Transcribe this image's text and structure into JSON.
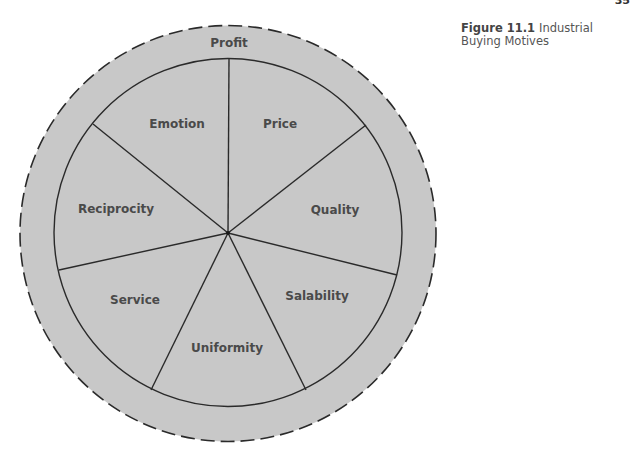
{
  "page_number": "35",
  "caption": {
    "label": "Figure 11.1",
    "title": "Industrial Buying Motives"
  },
  "diagram": {
    "type": "segmented-circle",
    "fill_color": "#c8c8c8",
    "line_color": "#2a2a2a",
    "text_color": "#4a4a4a",
    "outer_ring": {
      "label": "Profit",
      "border": "dashed"
    },
    "segments": [
      {
        "label": "Price"
      },
      {
        "label": "Quality"
      },
      {
        "label": "Salability"
      },
      {
        "label": "Uniformity"
      },
      {
        "label": "Service"
      },
      {
        "label": "Reciprocity"
      },
      {
        "label": "Emotion"
      }
    ]
  }
}
